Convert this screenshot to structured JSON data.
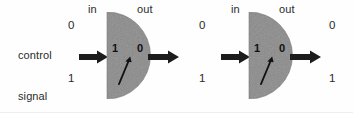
{
  "figure": {
    "type": "diagram",
    "background_color": "#fefefe",
    "dial_fill_color": "#8a8a8a",
    "ink_color": "#222222"
  },
  "control_label": {
    "line1": "control",
    "line2": "signal"
  },
  "units": [
    {
      "name": "left-gauge",
      "in_label": "in",
      "out_label": "out",
      "control_high": "0",
      "control_low": "1",
      "dial_left_value": "1",
      "dial_right_value": "0",
      "needle_angle_deg": -18,
      "has_input_arrow": true,
      "has_output_arrow": true
    },
    {
      "name": "right-gauge",
      "in_label": "in",
      "out_label": "out",
      "control_high": "0",
      "control_low": "1",
      "dial_left_value": "1",
      "dial_right_value": "0",
      "out_high": "0",
      "out_low": "1",
      "needle_angle_deg": -18,
      "has_input_arrow": true,
      "has_output_arrow": true
    }
  ]
}
